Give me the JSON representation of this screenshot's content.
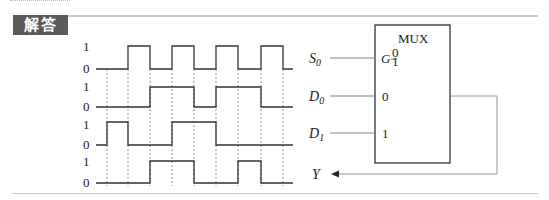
{
  "header": {
    "tag_label": "解答"
  },
  "waveform": {
    "level_high": "1",
    "level_low": "0",
    "rows": [
      {
        "name": "S0",
        "levels": [
          0,
          0,
          1,
          0,
          1,
          0,
          1,
          0,
          1,
          0
        ]
      },
      {
        "name": "D0",
        "levels": [
          0,
          0,
          0,
          1,
          1,
          0,
          1,
          1,
          0,
          0
        ]
      },
      {
        "name": "D1",
        "levels": [
          0,
          1,
          0,
          0,
          1,
          1,
          0,
          0,
          0,
          0
        ]
      },
      {
        "name": "Y",
        "levels": [
          0,
          0,
          0,
          1,
          1,
          0,
          0,
          1,
          0,
          0
        ]
      }
    ]
  },
  "mux": {
    "title": "MUX",
    "select_label": "G",
    "select_top": "0",
    "select_bottom": "1",
    "input0_label": "0",
    "input1_label": "1",
    "inputs": {
      "s0": "S",
      "s0_sub": "0",
      "d0": "D",
      "d0_sub": "0",
      "d1": "D",
      "d1_sub": "1"
    },
    "output_label": "Y"
  }
}
